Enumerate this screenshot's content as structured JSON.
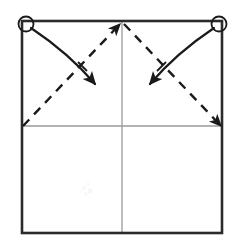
{
  "figure": {
    "title": "Origami fold step diagram",
    "caption": "",
    "background_color": "#ffffff",
    "canvas": {
      "width": 240,
      "height": 250
    }
  },
  "colors": {
    "outline": "#2b2b2b",
    "crease": "#9a9a9a",
    "fold_guide": "#1a1a1a",
    "motion_arrow": "#1a1a1a",
    "marker_stroke": "#1a1a1a",
    "paper_fill": "#ffffff",
    "artifact": "#f2f2f2"
  },
  "geometry": {
    "sheet": {
      "left": 22,
      "top": 21,
      "right": 222,
      "bottom": 233
    },
    "center_vertical_x": 122,
    "center_horizontal_y": 126,
    "apex": {
      "x": 122,
      "y": 23
    }
  },
  "elements": {
    "sheet_outline": {
      "label": "Square sheet outline",
      "stroke_width": 2.6
    },
    "crease_vertical": {
      "label": "Vertical center crease",
      "style": "solid-light",
      "stroke_width": 1.2
    },
    "crease_horizontal": {
      "label": "Horizontal center crease",
      "style": "solid-light",
      "stroke_width": 1.2
    },
    "corner_markers": [
      {
        "name": "top-left-corner-marker",
        "cx": 26,
        "cy": 24,
        "r": 7.5
      },
      {
        "name": "top-right-corner-marker",
        "cx": 219,
        "cy": 24,
        "r": 7.5
      }
    ],
    "fold_guides": [
      {
        "name": "left-fold-guide",
        "label": "Dashed diagonal from left edge midpoint to top center",
        "style": "dashed",
        "x1": 23,
        "y1": 126,
        "x2": 120,
        "y2": 24,
        "dash": "9 7",
        "stroke_width": 2.4
      },
      {
        "name": "right-fold-guide",
        "label": "Dashed diagonal from top center to right edge midpoint",
        "style": "dashed",
        "x1": 124,
        "y1": 24,
        "x2": 221,
        "y2": 126,
        "dash": "9 7",
        "stroke_width": 2.4
      }
    ],
    "motion_arrows": [
      {
        "name": "left-motion-arrow",
        "label": "Curved arrow from top-left corner to left fold guide",
        "direction": "down-right",
        "path": "M 31 28 C 55 44, 78 64, 95 84",
        "tip": {
          "x": 98,
          "y": 89
        },
        "tip_angle_deg": 50,
        "stroke_width": 2.2
      },
      {
        "name": "right-motion-arrow",
        "label": "Curved arrow from top-right corner to right fold guide",
        "direction": "down-left",
        "path": "M 214 28 C 190 44, 167 64, 150 84",
        "tip": {
          "x": 147,
          "y": 89
        },
        "tip_angle_deg": 130,
        "stroke_width": 2.2
      }
    ],
    "tick_marks": [
      {
        "name": "left-arrow-tick",
        "x1": 78,
        "y1": 62,
        "x2": 87,
        "y2": 71
      },
      {
        "name": "right-arrow-tick",
        "x1": 166,
        "y1": 62,
        "x2": 157,
        "y2": 71
      }
    ],
    "artifact": {
      "name": "scan-artifact",
      "cx": 86,
      "cy": 190,
      "r": 9
    }
  }
}
